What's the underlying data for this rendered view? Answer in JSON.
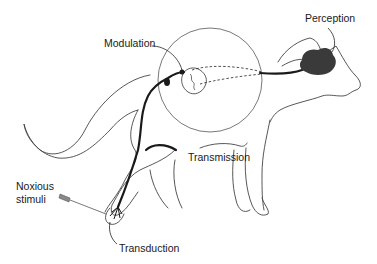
{
  "diagram": {
    "type": "anatomical-illustration",
    "labels": {
      "perception": "Perception",
      "modulation": "Modulation",
      "transmission": "Transmission",
      "noxious_stimuli_line1": "Noxious",
      "noxious_stimuli_line2": "stimuli",
      "transduction": "Transduction"
    },
    "colors": {
      "outline": "#444444",
      "nerve": "#1a1a1a",
      "brain": "#3a3a3a",
      "background": "#ffffff"
    }
  }
}
